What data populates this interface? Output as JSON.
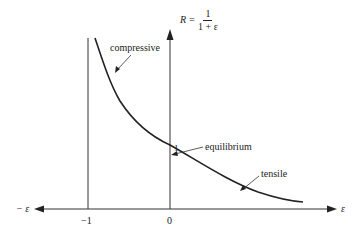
{
  "formula": {
    "lhs": "R =",
    "numerator": "1",
    "denominator": "1 + ε"
  },
  "axes": {
    "x_neg_label": "− ε",
    "x_pos_label": "ε",
    "tick_minus_one": "−1",
    "tick_zero": "0",
    "point_one": "1"
  },
  "annotations": {
    "compressive": "compressive",
    "equilibrium": "equilibrium",
    "tensile": "tensile"
  },
  "colors": {
    "ink": "#222222",
    "axis": "#333333",
    "background": "#ffffff"
  }
}
